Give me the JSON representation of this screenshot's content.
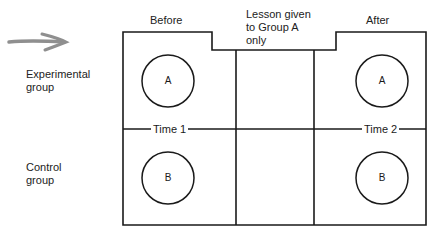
{
  "diagram": {
    "title": "",
    "columns": {
      "before": "Before",
      "treatment": "Lesson given\nto Group A\nonly",
      "treatment_lines": [
        "Lesson given",
        "to Group A",
        "only"
      ],
      "after": "After"
    },
    "rows": {
      "experimental": [
        "Experimental",
        "group"
      ],
      "control": [
        "Control",
        "group"
      ]
    },
    "time_markers": [
      "Time 1",
      "Time 2"
    ],
    "groups": {
      "before_top": "A",
      "before_bottom": "B",
      "after_top": "A",
      "after_bottom": "B"
    },
    "arrow": "hand-drawn-arrow",
    "colors": {
      "line": "#1a1a1a",
      "arrow": "#8a8a8a",
      "background": "#ffffff"
    }
  }
}
